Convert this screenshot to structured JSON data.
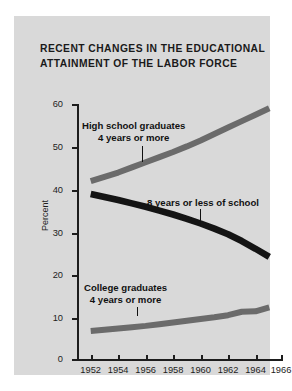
{
  "title": {
    "line1": "Recent changes in the educational",
    "line2": "attainment of the labor force"
  },
  "chart_data": {
    "type": "line",
    "title": "RECENT CHANGES IN THE EDUCATIONAL ATTAINMENT OF THE LABOR FORCE",
    "xlabel": "",
    "ylabel": "Percent",
    "xlim": [
      1951,
      1966
    ],
    "ylim": [
      0,
      60
    ],
    "grid": false,
    "legend": "inline-annotations",
    "yticks": [
      0,
      10,
      20,
      30,
      40,
      50,
      60
    ],
    "xticks": [
      1952,
      1954,
      1956,
      1958,
      1960,
      1962,
      1964,
      1966
    ],
    "x": [
      1952,
      1953,
      1954,
      1955,
      1956,
      1957,
      1958,
      1959,
      1960,
      1961,
      1962,
      1963,
      1964,
      1965
    ],
    "series": [
      {
        "name": "High school graduates 4 years or more",
        "color": "#6b6b6b",
        "values": [
          42.0,
          43.0,
          44.0,
          45.2,
          46.4,
          47.6,
          48.8,
          50.1,
          51.5,
          53.0,
          54.5,
          56.0,
          57.5,
          59.0
        ]
      },
      {
        "name": "8 years or less of school",
        "color": "#141414",
        "values": [
          39.0,
          38.3,
          37.6,
          36.8,
          36.0,
          35.1,
          34.2,
          33.2,
          32.1,
          30.9,
          29.6,
          28.0,
          26.2,
          24.3
        ]
      },
      {
        "name": "College graduates 4 years or more",
        "color": "#6b6b6b",
        "values": [
          7.0,
          7.3,
          7.6,
          7.9,
          8.2,
          8.6,
          9.0,
          9.4,
          9.8,
          10.2,
          10.7,
          11.5,
          11.6,
          12.5
        ]
      }
    ]
  },
  "axis": {
    "y_label": "Percent",
    "y_ticks": [
      "60",
      "50",
      "40",
      "30",
      "20",
      "10",
      "0"
    ],
    "x_ticks": [
      "1952",
      "1954",
      "1956",
      "1958",
      "1960",
      "1962",
      "1964",
      "1966"
    ]
  },
  "annotations": {
    "high_school": {
      "line1": "High school graduates",
      "line2": "4 years or more"
    },
    "eight_years": {
      "line1": "8 years or less of school"
    },
    "college": {
      "line1": "College graduates",
      "line2": "4 years or more"
    }
  },
  "colors": {
    "panel_background": "#d9d9d9",
    "page_background": "#ffffff",
    "axis": "#1d1d1d",
    "series_gray": "#6b6b6b",
    "series_black": "#141414",
    "text": "#111111"
  }
}
